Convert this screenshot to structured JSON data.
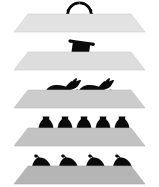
{
  "figure": {
    "background_color": "#ffffff",
    "silhouette_color": "#0a0a0a",
    "plane_outline_color": "#b8b8b8",
    "layer_count": 5,
    "icon_total": 13
  },
  "layers": [
    {
      "index": 1,
      "name": "laurel-wreath-layer",
      "plane_color": "#e2e2e2",
      "plane_top_y": 14,
      "plane_height": 18,
      "icon_name": "laurel-wreath-icon",
      "icon_label": "Laurel wreath",
      "icon_count": 1,
      "icon_count_label": "1"
    },
    {
      "index": 2,
      "name": "scroll-layer",
      "plane_color": "#dddddd",
      "plane_top_y": 52,
      "plane_height": 18,
      "icon_name": "scroll-icon",
      "icon_label": "Rolled scroll",
      "icon_count": 1,
      "icon_count_label": "1"
    },
    {
      "index": 3,
      "name": "horses-layer",
      "plane_color": "#cccccc",
      "plane_top_y": 90,
      "plane_height": 18,
      "icon_name": "horse-icon",
      "icon_label": "Galloping horse",
      "icon_count": 2,
      "icon_count_label": "2"
    },
    {
      "index": 4,
      "name": "vases-layer",
      "plane_color": "#c2c2c2",
      "plane_top_y": 128,
      "plane_height": 18,
      "icon_name": "amphora-vase-icon",
      "icon_label": "Amphora vase",
      "icon_count": 5,
      "icon_count_label": "5"
    },
    {
      "index": 5,
      "name": "helmets-layer",
      "plane_color": "#b5b5b5",
      "plane_top_y": 166,
      "plane_height": 18,
      "icon_name": "plumed-helmet-icon",
      "icon_label": "Plumed helmet with spear",
      "icon_count": 4,
      "icon_count_label": "4"
    }
  ],
  "plane_geometry": {
    "top_left_x": 28,
    "top_right_x": 131,
    "bottom_left_x": 14,
    "bottom_right_x": 145,
    "note": "Trapezoid seen in perspective: narrow far edge on top, wide near edge on bottom."
  }
}
